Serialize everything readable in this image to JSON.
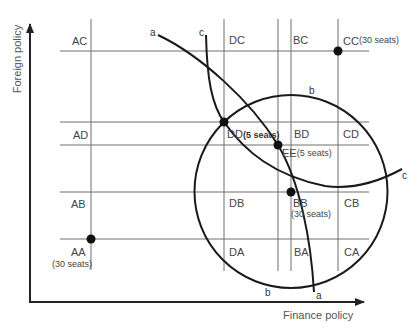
{
  "axes": {
    "x_label": "Finance policy",
    "y_label": "Foreign policy"
  },
  "curves": {
    "a": {
      "label_start": "a",
      "label_end": "a"
    },
    "b": {
      "label_top": "b",
      "label_bottom": "b"
    },
    "c": {
      "label_start": "c",
      "label_end": "c"
    }
  },
  "cells": {
    "row_top": {
      "AC": "AC",
      "DC": "DC",
      "BC": "BC",
      "CC": "CC",
      "CC_seats": "(30 seats)"
    },
    "row_upper": {
      "AD": "AD",
      "DD": "DD",
      "DD_seats": "(5 seats)",
      "BD": "BD",
      "CD": "CD"
    },
    "ee": {
      "EE": "EE",
      "EE_seats": "(5 seats)"
    },
    "row_lower": {
      "AB": "AB",
      "DB": "DB",
      "BB": "BB",
      "BB_seats": "(30 seats)",
      "CB": "CB"
    },
    "row_bottom": {
      "AA": "AA",
      "AA_seats": "(30 seats)",
      "DA": "DA",
      "BA": "BA",
      "CA": "CA"
    }
  },
  "points": [
    {
      "name": "CC",
      "seats": 30
    },
    {
      "name": "DD",
      "seats": 5
    },
    {
      "name": "EE",
      "seats": 5
    },
    {
      "name": "BB",
      "seats": 30
    },
    {
      "name": "AA",
      "seats": 30
    }
  ]
}
